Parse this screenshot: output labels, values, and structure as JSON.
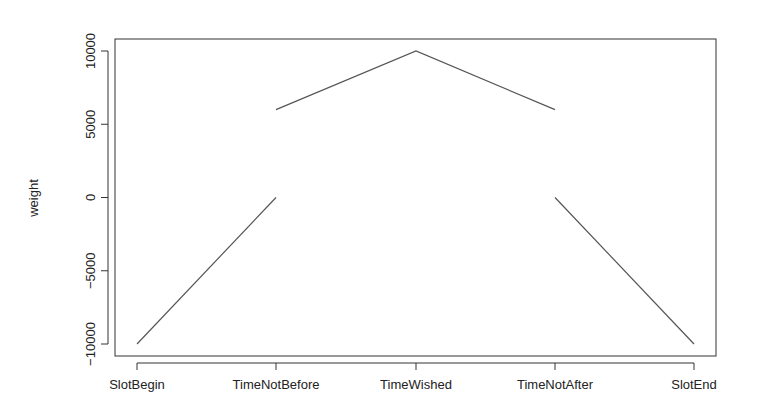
{
  "chart_data": {
    "type": "line",
    "title": "",
    "xlabel": "",
    "ylabel": "weight",
    "categories": [
      "SlotBegin",
      "TimeNotBefore",
      "TimeWished",
      "TimeNotAfter",
      "SlotEnd"
    ],
    "segments": [
      {
        "name": "rise",
        "points": [
          [
            "SlotBegin",
            -10000
          ],
          [
            "TimeNotBefore",
            0
          ]
        ]
      },
      {
        "name": "peak",
        "points": [
          [
            "TimeNotBefore",
            6000
          ],
          [
            "TimeWished",
            10000
          ],
          [
            "TimeNotAfter",
            6000
          ]
        ]
      },
      {
        "name": "fall",
        "points": [
          [
            "TimeNotAfter",
            0
          ],
          [
            "SlotEnd",
            -10000
          ]
        ]
      }
    ],
    "yticks": [
      -10000,
      -5000,
      0,
      5000,
      10000
    ],
    "ytick_labels": [
      "-10000",
      "-5000",
      "0",
      "5000",
      "10000"
    ],
    "ylim": [
      -10800,
      10800
    ],
    "grid": false,
    "legend": null,
    "line_color": "#555555"
  },
  "layout": {
    "plot": {
      "left": 115,
      "right": 716,
      "top": 39,
      "bottom": 356
    },
    "x_positions": [
      137,
      276,
      416,
      555,
      694
    ],
    "y_map": {
      "v10000": 51,
      "vneg10000": 344
    }
  }
}
